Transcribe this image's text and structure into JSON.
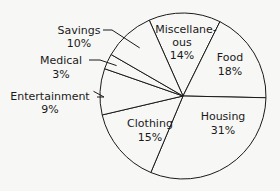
{
  "chart_data": {
    "type": "pie",
    "title": "",
    "unit": "%",
    "start_category": "Miscellaneous",
    "slices": [
      {
        "label": "Miscellane-",
        "label2": "ous",
        "name": "Miscellaneous",
        "value": 14,
        "value_label": "14%"
      },
      {
        "label": "Food",
        "name": "Food",
        "value": 18,
        "value_label": "18%"
      },
      {
        "label": "Housing",
        "name": "Housing",
        "value": 31,
        "value_label": "31%"
      },
      {
        "label": "Clothing",
        "name": "Clothing",
        "value": 15,
        "value_label": "15%"
      },
      {
        "label": "Entertainment",
        "name": "Entertainment",
        "value": 9,
        "value_label": "9%"
      },
      {
        "label": "Medical",
        "name": "Medical",
        "value": 3,
        "value_label": "3%"
      },
      {
        "label": "Savings",
        "name": "Savings",
        "value": 10,
        "value_label": "10%"
      }
    ],
    "colors": {
      "fill": "#f7f7f5",
      "stroke": "#1a1a1a",
      "text": "#1a1a1a"
    }
  }
}
